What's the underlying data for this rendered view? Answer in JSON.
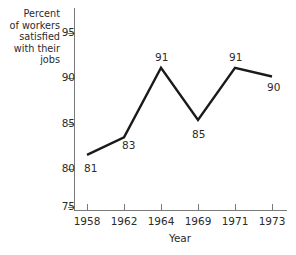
{
  "chart_data": {
    "type": "line",
    "title": "",
    "subtitle": "",
    "xlabel": "Year",
    "ylabel": "Percent of workers satisfied with their jobs",
    "categories": [
      "1958",
      "1962",
      "1964",
      "1969",
      "1971",
      "1973"
    ],
    "x": [
      1958,
      1962,
      1964,
      1969,
      1971,
      1973
    ],
    "values": [
      81,
      83,
      91,
      85,
      91,
      90
    ],
    "point_labels": [
      "81",
      "83",
      "91",
      "85",
      "91",
      "90"
    ],
    "series": [
      {
        "name": "Percent of workers satisfied with their jobs",
        "values": [
          81,
          83,
          91,
          85,
          91,
          90
        ],
        "color": "#1a1a1a"
      }
    ],
    "yticks": [
      75,
      80,
      85,
      90,
      95
    ],
    "ytick_labels": [
      "75",
      "80",
      "85",
      "90",
      "95"
    ],
    "ylim": [
      73.5,
      96.8
    ],
    "grid": false,
    "legend": "none",
    "markers": false,
    "line_color": "#1a1a1a",
    "axis_color": "#7a7a7a",
    "background_color": "#ffffff",
    "annotations": []
  },
  "axes": {
    "y_title_lines": [
      "Percent",
      "of workers",
      "satisfied",
      "with their",
      "jobs"
    ],
    "x_title": "Year"
  }
}
